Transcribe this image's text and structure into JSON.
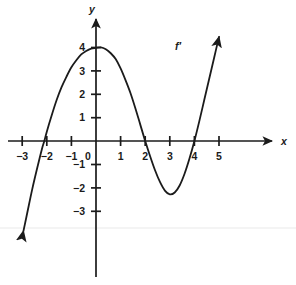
{
  "chart_data": {
    "type": "line",
    "title": "",
    "subtitle": "",
    "xlabel": "x",
    "ylabel": "y",
    "xlim": [
      -3.4,
      5.9
    ],
    "ylim": [
      -3.9,
      4.6
    ],
    "grid": false,
    "legend_position": "none",
    "curve_label": "f′",
    "x_ticks": [
      -3,
      -2,
      -1,
      0,
      1,
      2,
      3,
      4,
      5
    ],
    "x_tick_labels": [
      "−3",
      "−2",
      "−1",
      "0",
      "1",
      "2",
      "3",
      "4",
      "5"
    ],
    "y_ticks": [
      -3,
      -2,
      -1,
      1,
      2,
      3,
      4
    ],
    "y_tick_labels": [
      "−3",
      "−2",
      "−1",
      "1",
      "2",
      "3",
      "4"
    ],
    "annotations": {
      "x_intercepts": [
        -2.1,
        2.0,
        4.0
      ],
      "local_maximum": {
        "x": 0.2,
        "y": 4.0
      },
      "local_minimum": {
        "x": 3.0,
        "y": -2.3
      },
      "y_intercept": 3.95,
      "arrow_start_direction": "down-left",
      "arrow_end_direction": "up-right"
    },
    "series": [
      {
        "name": "f′",
        "points": [
          {
            "x": -2.95,
            "y": -3.85
          },
          {
            "x": -2.8,
            "y": -3.1
          },
          {
            "x": -2.6,
            "y": -2.1
          },
          {
            "x": -2.4,
            "y": -1.2
          },
          {
            "x": -2.2,
            "y": -0.35
          },
          {
            "x": -2.1,
            "y": 0.0
          },
          {
            "x": -2.0,
            "y": 0.4
          },
          {
            "x": -1.8,
            "y": 1.1
          },
          {
            "x": -1.6,
            "y": 1.75
          },
          {
            "x": -1.4,
            "y": 2.3
          },
          {
            "x": -1.2,
            "y": 2.75
          },
          {
            "x": -1.0,
            "y": 3.15
          },
          {
            "x": -0.8,
            "y": 3.45
          },
          {
            "x": -0.6,
            "y": 3.7
          },
          {
            "x": -0.4,
            "y": 3.85
          },
          {
            "x": -0.2,
            "y": 3.95
          },
          {
            "x": 0.0,
            "y": 3.98
          },
          {
            "x": 0.2,
            "y": 4.0
          },
          {
            "x": 0.4,
            "y": 3.92
          },
          {
            "x": 0.6,
            "y": 3.75
          },
          {
            "x": 0.8,
            "y": 3.5
          },
          {
            "x": 1.0,
            "y": 3.1
          },
          {
            "x": 1.2,
            "y": 2.6
          },
          {
            "x": 1.4,
            "y": 2.05
          },
          {
            "x": 1.6,
            "y": 1.4
          },
          {
            "x": 1.8,
            "y": 0.7
          },
          {
            "x": 2.0,
            "y": 0.0
          },
          {
            "x": 2.2,
            "y": -0.65
          },
          {
            "x": 2.4,
            "y": -1.25
          },
          {
            "x": 2.6,
            "y": -1.75
          },
          {
            "x": 2.8,
            "y": -2.12
          },
          {
            "x": 3.0,
            "y": -2.28
          },
          {
            "x": 3.2,
            "y": -2.2
          },
          {
            "x": 3.4,
            "y": -1.9
          },
          {
            "x": 3.6,
            "y": -1.4
          },
          {
            "x": 3.8,
            "y": -0.75
          },
          {
            "x": 4.0,
            "y": 0.0
          },
          {
            "x": 4.2,
            "y": 0.85
          },
          {
            "x": 4.4,
            "y": 1.75
          },
          {
            "x": 4.6,
            "y": 2.65
          },
          {
            "x": 4.8,
            "y": 3.55
          },
          {
            "x": 5.0,
            "y": 4.45
          }
        ]
      }
    ]
  },
  "axes": {
    "x_axis_label": "x",
    "y_axis_label": "y"
  }
}
